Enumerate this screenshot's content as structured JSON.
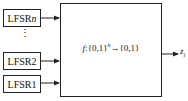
{
  "diagram": {
    "inputs": [
      {
        "label_prefix": "LFSR",
        "label_suffix": "n",
        "suffix_italic": true
      },
      {
        "label": "LFSR2"
      },
      {
        "label": "LFSR1"
      }
    ],
    "ellipsis": "⋮",
    "function_box": {
      "f": "f",
      "colon": ":",
      "domain": "{0,1}",
      "exponent": "n",
      "arrow": "→",
      "codomain": "{0,1}"
    },
    "output": {
      "symbol": "z",
      "subscript": "i"
    }
  }
}
